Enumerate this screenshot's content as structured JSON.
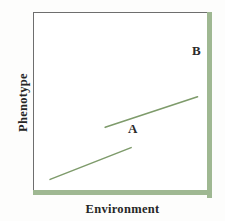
{
  "chart_data": {
    "type": "line",
    "title": "",
    "xlabel": "Environment",
    "ylabel": "Phenotype",
    "xlim": [
      0,
      100
    ],
    "ylim": [
      0,
      100
    ],
    "grid": false,
    "legend": "none",
    "annotations": [
      {
        "text": "A",
        "x": 55,
        "y": 32
      },
      {
        "text": "B",
        "x": 92,
        "y": 76
      }
    ],
    "series": [
      {
        "name": "A",
        "label": "A",
        "color": "#7e9b6b",
        "points": [
          {
            "x": 5,
            "y": 6
          },
          {
            "x": 55,
            "y": 31
          }
        ]
      },
      {
        "name": "B",
        "label": "B",
        "color": "#7e9b6b",
        "points": [
          {
            "x": 39,
            "y": 47
          },
          {
            "x": 96,
            "y": 71
          }
        ]
      }
    ]
  },
  "figure": {
    "axis_label_x": "Environment",
    "axis_label_y": "Phenotype",
    "label_a": "A",
    "label_b": "B",
    "colors": {
      "axis_green": "#9fb892",
      "frame_gray": "#6e6e6e",
      "line": "#7e9b6b",
      "text": "#262626",
      "background": "#fdfdfc"
    }
  }
}
